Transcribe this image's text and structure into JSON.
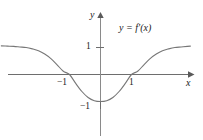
{
  "figure": {
    "kind": "math-graph",
    "background_color": "#ffffff",
    "ink_color": "#4a4a4a",
    "text_color": "#1a1a1a"
  },
  "axes": {
    "x_axis_label": "x",
    "y_axis_label": "y",
    "x_ticks": [
      {
        "value": -1,
        "label": "−1"
      },
      {
        "value": 1,
        "label": "1"
      }
    ],
    "y_ticks": [
      {
        "value": 1,
        "label": "1"
      },
      {
        "value": -1,
        "label": "−1"
      }
    ],
    "origin_px": {
      "x": 100,
      "y": 74
    },
    "unit_px": {
      "x": 31,
      "y": 27
    },
    "xlim": [
      -3.2,
      2.9
    ],
    "ylim": [
      -2.4,
      2.2
    ],
    "grid": false,
    "arrow_heads": [
      "x-positive",
      "y-positive"
    ]
  },
  "curve": {
    "label": "y = f′(x)",
    "label_parts": {
      "y": "y",
      "equals": "=",
      "f_prime": "f′",
      "arg": "(x)"
    },
    "color": "#777777",
    "stroke_width": 1.1,
    "description": "even, U-shaped curve with minimum at the origin region, zeros at x = -1 and x = 1, flattening toward y = 1 on both ends"
  },
  "chart_data": {
    "type": "line",
    "title": "",
    "xlabel": "x",
    "ylabel": "y",
    "xlim": [
      -3.2,
      2.9
    ],
    "ylim": [
      -2.4,
      2.2
    ],
    "grid": false,
    "legend": [
      "y = f′(x)"
    ],
    "legend_position": "upper-right-inside",
    "annotations": [
      {
        "text": "y = f′(x)",
        "x": 1.05,
        "y": 1.8
      }
    ],
    "xticks": [
      -1,
      1
    ],
    "xticklabels": [
      "−1",
      "1"
    ],
    "yticks": [
      1,
      -1
    ],
    "yticklabels": [
      "1",
      "−1"
    ],
    "series": [
      {
        "name": "y = f′(x)",
        "x": [
          -3.2,
          -3.0,
          -2.8,
          -2.6,
          -2.4,
          -2.2,
          -2.0,
          -1.8,
          -1.6,
          -1.4,
          -1.2,
          -1.0,
          -0.8,
          -0.6,
          -0.4,
          -0.2,
          0.0,
          0.2,
          0.4,
          0.6,
          0.8,
          1.0,
          1.2,
          1.4,
          1.6,
          1.8,
          2.0,
          2.2,
          2.4,
          2.6,
          2.8,
          2.9
        ],
        "y": [
          1.06,
          1.05,
          1.04,
          1.02,
          1.0,
          0.95,
          0.88,
          0.76,
          0.59,
          0.36,
          0.12,
          0.0,
          -0.33,
          -0.63,
          -0.85,
          -0.97,
          -1.0,
          -0.97,
          -0.85,
          -0.63,
          -0.33,
          0.0,
          0.12,
          0.36,
          0.59,
          0.76,
          0.88,
          0.95,
          1.0,
          1.02,
          1.04,
          1.05
        ]
      }
    ],
    "zeros": [
      -1,
      1
    ],
    "minimum": {
      "x": 0,
      "y": -1
    },
    "asymptotic_value": 1.05
  }
}
